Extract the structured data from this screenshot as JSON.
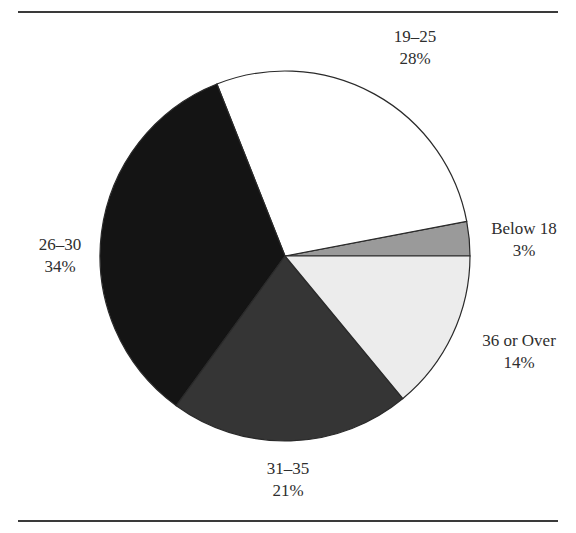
{
  "chart_data": {
    "type": "pie",
    "title": "",
    "slices": [
      {
        "label": "Below 18",
        "value": 3,
        "display": "3%",
        "color": "#9a9a9a"
      },
      {
        "label": "19–25",
        "value": 28,
        "display": "28%",
        "color": "#ffffff"
      },
      {
        "label": "26–30",
        "value": 34,
        "display": "34%",
        "color": "#141414"
      },
      {
        "label": "31–35",
        "value": 21,
        "display": "21%",
        "color": "#353535"
      },
      {
        "label": "36 or Over",
        "value": 14,
        "display": "14%",
        "color": "#ececec"
      }
    ],
    "categories": [
      "Below 18",
      "19–25",
      "26–30",
      "31–35",
      "36 or Over"
    ],
    "values": [
      3,
      28,
      34,
      21,
      14
    ],
    "start_angle_deg": 0,
    "direction": "counterclockwise",
    "legend": "none (direct labels)"
  },
  "labels": {
    "below18": {
      "name": "Below 18",
      "pct": "3%"
    },
    "a19_25": {
      "name": "19–25",
      "pct": "28%"
    },
    "a26_30": {
      "name": "26–30",
      "pct": "34%"
    },
    "a31_35": {
      "name": "31–35",
      "pct": "21%"
    },
    "a36plus": {
      "name": "36 or Over",
      "pct": "14%"
    }
  }
}
